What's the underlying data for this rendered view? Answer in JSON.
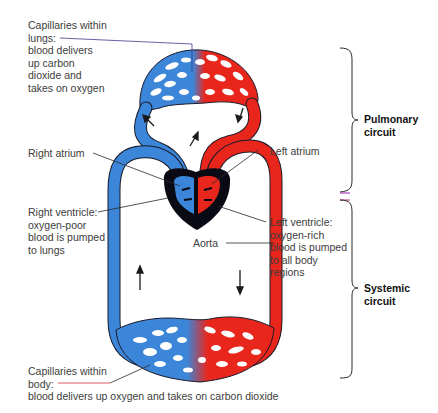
{
  "labels": {
    "lung_capillaries": {
      "lines": [
        "Capillaries within",
        "lungs:",
        "blood delivers",
        "up carbon",
        "dioxide and",
        "takes on oxygen"
      ]
    },
    "right_atrium": "Right atrium",
    "left_atrium": "Left atrium",
    "right_ventricle": {
      "lines": [
        "Right ventricle:",
        "oxygen-poor",
        "blood is pumped",
        "to lungs"
      ]
    },
    "left_ventricle": {
      "lines": [
        "Left ventricle:",
        "oxygen-rich",
        "blood is pumped",
        "to all body",
        "regions"
      ]
    },
    "aorta": "Aorta",
    "body_capillaries": {
      "lines": [
        "Capillaries within",
        "body:",
        "blood delivers up oxygen and takes on carbon dioxide"
      ]
    }
  },
  "circuits": {
    "pulmonary": [
      "Pulmonary",
      "circuit"
    ],
    "systemic": [
      "Systemic",
      "circuit"
    ]
  },
  "colors": {
    "deoxygenated_blood": "#3b86d8",
    "oxygenated_blood": "#e8261c",
    "heart_muscle": "#0a0a14",
    "outline": "#1a1a2a"
  }
}
